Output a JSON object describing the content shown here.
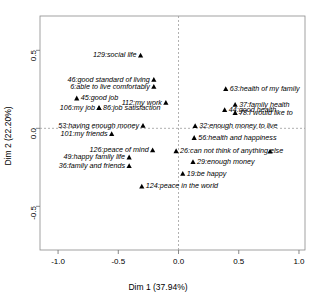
{
  "chart_data": {
    "type": "scatter",
    "title": "",
    "xlabel": "Dim 1 (37.94%)",
    "ylabel": "Dim 2 (22.20%)",
    "xlim": [
      -1.15,
      1.05
    ],
    "ylim": [
      -0.78,
      0.72
    ],
    "xticks": [
      "-1.0",
      "-0.5",
      "0.0",
      "0.5",
      "1.0"
    ],
    "xtickvalues": [
      -1.0,
      -0.5,
      0.0,
      0.5,
      1.0
    ],
    "yticks": [
      "0.5",
      "0.0",
      "-0.5"
    ],
    "ytickvalues": [
      0.5,
      0.0,
      -0.5
    ],
    "grid": false,
    "reference_lines": {
      "x": 0.0,
      "y": 0.0,
      "style": "dashed"
    },
    "legend": "none",
    "marker": "triangle",
    "marker_color": "#000000",
    "points": [
      {
        "id": 129,
        "label": "129:social life",
        "x": -0.315,
        "y": 0.468,
        "side": "right"
      },
      {
        "id": 46,
        "label": "46:good standard of living",
        "x": -0.205,
        "y": 0.312,
        "side": "right"
      },
      {
        "id": 6,
        "label": "6:able to live comfortably",
        "x": -0.205,
        "y": 0.268,
        "side": "right"
      },
      {
        "id": 63,
        "label": "63:health of my family",
        "x": 0.392,
        "y": 0.253,
        "side": "left"
      },
      {
        "id": 45,
        "label": "45:good job",
        "x": -0.845,
        "y": 0.193,
        "side": "left"
      },
      {
        "id": 112,
        "label": "112:my work",
        "x": -0.105,
        "y": 0.165,
        "side": "right"
      },
      {
        "id": 37,
        "label": "37:family health",
        "x": 0.47,
        "y": 0.152,
        "side": "left"
      },
      {
        "id": 106,
        "label": "106:my job",
        "x": -0.66,
        "y": 0.132,
        "side": "right"
      },
      {
        "id": 86,
        "label": "86:job satisfaction",
        "x": -0.66,
        "y": 0.132,
        "side": "left"
      },
      {
        "id": 44,
        "label": "44:good health",
        "x": 0.383,
        "y": 0.118,
        "side": "left"
      },
      {
        "id": 78,
        "label": "78:I would like to",
        "x": 0.47,
        "y": 0.1,
        "side": "left"
      },
      {
        "id": 53,
        "label": "53:having enough money",
        "x": -0.295,
        "y": 0.018,
        "side": "right"
      },
      {
        "id": 32,
        "label": "32:enough money to live",
        "x": 0.138,
        "y": 0.016,
        "side": "left"
      },
      {
        "id": 101,
        "label": "101:my friends",
        "x": -0.555,
        "y": -0.035,
        "side": "right"
      },
      {
        "id": 56,
        "label": "56:health and happiness",
        "x": 0.13,
        "y": -0.06,
        "side": "left"
      },
      {
        "id": 126,
        "label": "126:peace of mind",
        "x": -0.215,
        "y": -0.14,
        "side": "right"
      },
      {
        "id": 26,
        "label": "26:can not think of anything else",
        "x": -0.02,
        "y": -0.145,
        "side": "left"
      },
      {
        "id": 49,
        "label": "49:happy family life",
        "x": -0.41,
        "y": -0.185,
        "side": "right"
      },
      {
        "id": 29,
        "label": "29:enough money",
        "x": 0.12,
        "y": -0.215,
        "side": "left"
      },
      {
        "id": 36,
        "label": "36:family and friends",
        "x": -0.41,
        "y": -0.24,
        "side": "right"
      },
      {
        "id": 19,
        "label": "19:be happy",
        "x": 0.035,
        "y": -0.29,
        "side": "left"
      },
      {
        "id": 124,
        "label": "124:peace in the world",
        "x": -0.305,
        "y": -0.372,
        "side": "left"
      },
      {
        "id": null,
        "label": "",
        "x": 0.76,
        "y": -0.148,
        "side": "left"
      }
    ]
  }
}
